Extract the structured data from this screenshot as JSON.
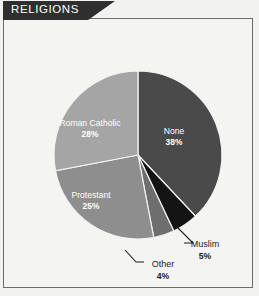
{
  "header": {
    "title": "RELIGIONS",
    "banner_color": "#2f2f2f"
  },
  "chart_data": {
    "type": "pie",
    "title": "RELIGIONS",
    "xlabel": "",
    "ylabel": "",
    "grid": false,
    "legend": "none",
    "start_angle_deg": 0,
    "direction": "clockwise",
    "categories": [
      "None",
      "Muslim",
      "Other",
      "Protestant",
      "Roman Catholic"
    ],
    "values": [
      38,
      5,
      4,
      25,
      28
    ],
    "unit": "%",
    "slices": [
      {
        "label": "None",
        "value": 38,
        "pct_text": "38%",
        "color": "#4a4a4a",
        "label_placement": "inside",
        "label_color": "#ffffff"
      },
      {
        "label": "Muslim",
        "value": 5,
        "pct_text": "5%",
        "color": "#141414",
        "label_placement": "outside",
        "label_color": "#1d1d1d"
      },
      {
        "label": "Other",
        "value": 4,
        "pct_text": "4%",
        "color": "#6e6e6e",
        "label_placement": "outside",
        "label_color": "#1d1d1d"
      },
      {
        "label": "Protestant",
        "value": 25,
        "pct_text": "25%",
        "color": "#8e8e8e",
        "label_placement": "inside",
        "label_color": "#ffffff"
      },
      {
        "label": "Roman Catholic",
        "value": 28,
        "pct_text": "28%",
        "color": "#a5a5a5",
        "label_placement": "inside",
        "label_color": "#ffffff"
      }
    ]
  },
  "colors": {
    "page_background": "#f2f2f0",
    "panel_background": "#f4f4f2",
    "frame_border": "#6d6d6d",
    "leader_line": "#1d1d1d"
  }
}
